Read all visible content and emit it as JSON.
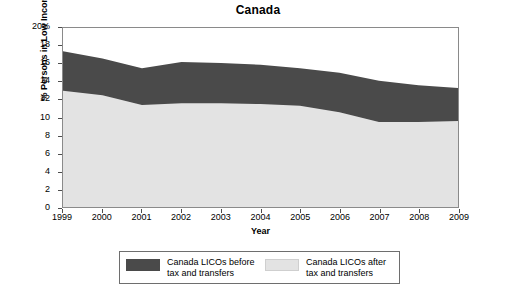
{
  "chart_data": {
    "type": "area",
    "title": "Canada",
    "xlabel": "Year",
    "ylabel": "% Persons in Low Income",
    "x": [
      1999,
      2000,
      2001,
      2002,
      2003,
      2004,
      2005,
      2006,
      2007,
      2008,
      2009
    ],
    "xticklabels": [
      "1999",
      "2000",
      "2001",
      "2002",
      "2003",
      "2004",
      "2005",
      "2006",
      "2007",
      "2008",
      "2009"
    ],
    "yticklabels": [
      "0",
      "2",
      "4",
      "6",
      "8",
      "10",
      "12",
      "14",
      "16",
      "18",
      "20%"
    ],
    "ytickvalues": [
      0,
      2,
      4,
      6,
      8,
      10,
      12,
      14,
      16,
      18,
      20
    ],
    "ylim": [
      0,
      20
    ],
    "xlim": [
      1999,
      2009
    ],
    "grid": false,
    "legend_position": "below-center",
    "stacked": false,
    "series": [
      {
        "name": "Canada LICOs before tax and transfers",
        "color": "#4a4a4a",
        "values": [
          17.4,
          16.6,
          15.5,
          16.2,
          16.1,
          15.9,
          15.5,
          15.0,
          14.1,
          13.6,
          13.3
        ]
      },
      {
        "name": "Canada LICOs after tax and transfers",
        "color": "#e3e3e3",
        "values": [
          13.0,
          12.5,
          11.4,
          11.6,
          11.6,
          11.5,
          11.3,
          10.6,
          9.5,
          9.5,
          9.6
        ]
      }
    ]
  },
  "legend": {
    "entries": [
      {
        "label_line1": "Canada LICOs before",
        "label_line2": "tax and transfers",
        "color": "#4a4a4a"
      },
      {
        "label_line1": "Canada LICOs after",
        "label_line2": "tax and transfers",
        "color": "#e3e3e3"
      }
    ]
  }
}
